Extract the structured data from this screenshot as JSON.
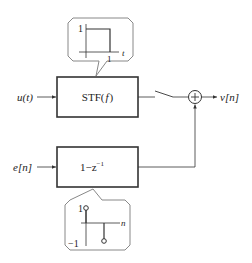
{
  "diagram": {
    "inputs": {
      "u": "u(t)",
      "e": "e[n]"
    },
    "output": "v[n]",
    "blocks": {
      "stf": {
        "label": "STF( f )",
        "label_main": "STF(",
        "label_var": "f",
        "label_close": ")"
      },
      "ntf": {
        "label": "1−z⁻¹",
        "label_main": "1−z",
        "label_exp": "−1"
      }
    },
    "sum_symbol": "+",
    "callouts": {
      "impulse_response_stf": {
        "y_tick": "1",
        "x_tick": "1",
        "x_axis": "t"
      },
      "impulse_response_ntf": {
        "y_tick_top": "1",
        "y_tick_bottom": "−1",
        "x_axis": "n"
      }
    },
    "colors": {
      "line": "#333333",
      "callout_border": "#888888",
      "callout_fill": "#ffffff"
    }
  }
}
